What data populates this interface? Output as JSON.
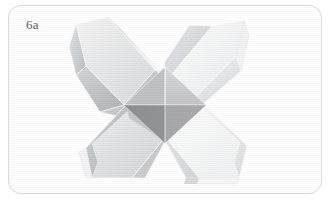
{
  "figure": {
    "label": "6a",
    "caption_alt": "Origami four-pointed star, step 6a",
    "panel": {
      "width": 333,
      "height": 202,
      "background_color": "#ffffff",
      "border_color": "#dcdcdc",
      "border_radius": 13,
      "border_rect": {
        "x": 8,
        "y": 5,
        "width": 314,
        "height": 189
      }
    },
    "label_style": {
      "color": "#5a5a5a",
      "font_size": 13,
      "x": 26,
      "y": 18
    },
    "model": {
      "type": "four-pointed-star",
      "center": {
        "x": 165,
        "y": 105
      },
      "arm_count": 4,
      "arms": [
        {
          "name": "top-left-arm",
          "tip": {
            "x": 76,
            "y": 24
          },
          "fill_light": "#ececed",
          "fill_mid": "#d2d3d4",
          "fill_dark": "#b9babb",
          "edge_color": "#ffffff",
          "shadow_color": "#a9aaac"
        },
        {
          "name": "top-right-arm",
          "tip": {
            "x": 244,
            "y": 20
          },
          "fill_light": "#fbfbfb",
          "fill_mid": "#eeeff0",
          "fill_dark": "#cfd0d2",
          "edge_color": "#ffffff",
          "shadow_color": "#bcbdbf"
        },
        {
          "name": "bottom-right-arm",
          "tip": {
            "x": 243,
            "y": 183
          },
          "fill_light": "#fcfcfc",
          "fill_mid": "#f2f2f3",
          "fill_dark": "#dcdddf",
          "edge_color": "#ffffff",
          "shadow_color": "#c6c7c9"
        },
        {
          "name": "bottom-left-arm",
          "tip": {
            "x": 77,
            "y": 182
          },
          "fill_light": "#e7e8e9",
          "fill_mid": "#d5d6d7",
          "fill_dark": "#c2c3c5",
          "edge_color": "#fdfdfd",
          "shadow_color": "#b0b1b3"
        }
      ],
      "core": {
        "name": "central-pyramid",
        "half_width": 41,
        "half_height": 38,
        "facets": [
          {
            "name": "core-facet-top",
            "fill": "#cdcecf"
          },
          {
            "name": "core-facet-left",
            "fill": "#8e8f91"
          },
          {
            "name": "core-facet-bottom",
            "fill": "#b4b5b7"
          },
          {
            "name": "core-facet-right",
            "fill": "#a5a6a8"
          }
        ]
      }
    }
  }
}
